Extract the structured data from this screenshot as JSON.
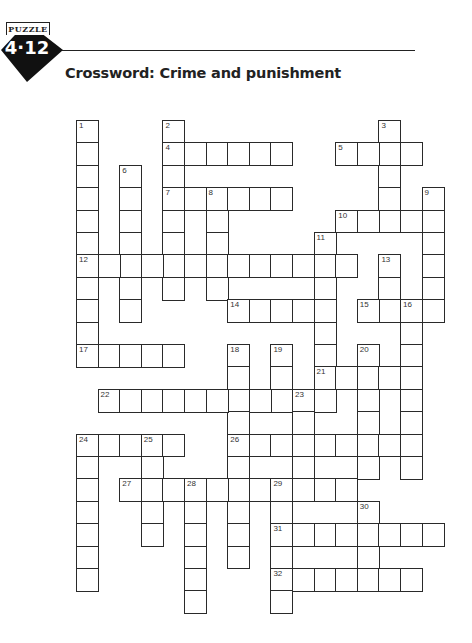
{
  "header": {
    "badge_label": "PUZZLE",
    "badge_number": "4·12",
    "title": "Crossword: Crime and punishment"
  },
  "grid": {
    "rows": 22,
    "cols": 18,
    "cell_width": 21.6,
    "cell_height": 22.4,
    "origin": [
      76,
      120
    ],
    "border_color": "#2a2a2a"
  },
  "entries": [
    {
      "number": 1,
      "direction": "down",
      "row": 0,
      "col": 0,
      "length": 11
    },
    {
      "number": 2,
      "direction": "down",
      "row": 0,
      "col": 4,
      "length": 8
    },
    {
      "number": 3,
      "direction": "down",
      "row": 0,
      "col": 14,
      "length": 5
    },
    {
      "number": 4,
      "direction": "across",
      "row": 1,
      "col": 4,
      "length": 6
    },
    {
      "number": 5,
      "direction": "across",
      "row": 1,
      "col": 12,
      "length": 4
    },
    {
      "number": 6,
      "direction": "down",
      "row": 2,
      "col": 2,
      "length": 7
    },
    {
      "number": 7,
      "direction": "across",
      "row": 3,
      "col": 4,
      "length": 6
    },
    {
      "number": 8,
      "direction": "down",
      "row": 3,
      "col": 6,
      "length": 5
    },
    {
      "number": 9,
      "direction": "down",
      "row": 3,
      "col": 16,
      "length": 6
    },
    {
      "number": 10,
      "direction": "across",
      "row": 4,
      "col": 12,
      "length": 5
    },
    {
      "number": 11,
      "direction": "down",
      "row": 5,
      "col": 11,
      "length": 8
    },
    {
      "number": 12,
      "direction": "across",
      "row": 6,
      "col": 0,
      "length": 13
    },
    {
      "number": 13,
      "direction": "down",
      "row": 6,
      "col": 14,
      "length": 3
    },
    {
      "number": 14,
      "direction": "across",
      "row": 8,
      "col": 7,
      "length": 5
    },
    {
      "number": 15,
      "direction": "across",
      "row": 8,
      "col": 13,
      "length": 4
    },
    {
      "number": 16,
      "direction": "down",
      "row": 8,
      "col": 15,
      "length": 8
    },
    {
      "number": 17,
      "direction": "across",
      "row": 10,
      "col": 0,
      "length": 5
    },
    {
      "number": 18,
      "direction": "down",
      "row": 10,
      "col": 7,
      "length": 10
    },
    {
      "number": 19,
      "direction": "down",
      "row": 10,
      "col": 9,
      "length": 3
    },
    {
      "number": 20,
      "direction": "down",
      "row": 10,
      "col": 13,
      "length": 6
    },
    {
      "number": 21,
      "direction": "across",
      "row": 11,
      "col": 11,
      "length": 5
    },
    {
      "number": 22,
      "direction": "across",
      "row": 12,
      "col": 1,
      "length": 11
    },
    {
      "number": 23,
      "direction": "down",
      "row": 12,
      "col": 10,
      "length": 5
    },
    {
      "number": 24,
      "direction": "across",
      "row": 14,
      "col": 0,
      "length": 5
    },
    {
      "number": 24,
      "direction": "down",
      "row": 14,
      "col": 0,
      "length": 7
    },
    {
      "number": 25,
      "direction": "down",
      "row": 14,
      "col": 3,
      "length": 5
    },
    {
      "number": 26,
      "direction": "across",
      "row": 14,
      "col": 7,
      "length": 9
    },
    {
      "number": 27,
      "direction": "across",
      "row": 16,
      "col": 2,
      "length": 11
    },
    {
      "number": 28,
      "direction": "down",
      "row": 16,
      "col": 5,
      "length": 6
    },
    {
      "number": 29,
      "direction": "down",
      "row": 16,
      "col": 9,
      "length": 6
    },
    {
      "number": 30,
      "direction": "down",
      "row": 17,
      "col": 13,
      "length": 4
    },
    {
      "number": 31,
      "direction": "across",
      "row": 18,
      "col": 9,
      "length": 8
    },
    {
      "number": 32,
      "direction": "across",
      "row": 20,
      "col": 9,
      "length": 7
    }
  ]
}
